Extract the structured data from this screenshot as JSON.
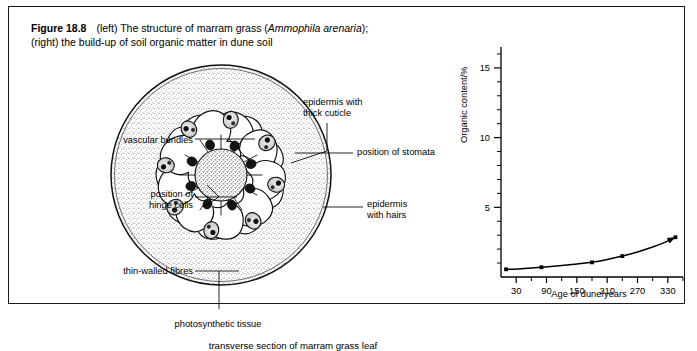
{
  "figure": {
    "number_label": "Figure 18.8",
    "caption_line1_a": "(left) The structure of marram grass (",
    "caption_species": "Ammophila arenaria",
    "caption_line1_b": ");",
    "caption_line2": "(right) the build-up of soil organic matter in dune soil"
  },
  "leaf_diagram": {
    "subcaption": "transverse section of marram grass leaf",
    "labels": {
      "vascular_bundles": "vascular bundles",
      "hinge_cells": "position of\nhinge cells",
      "thin_walled_fibres": "thin-walled fibres",
      "photosynthetic_tissue": "photosynthetic tissue",
      "epidermis_cuticle": "epidermis with\nthick cuticle",
      "stomata": "position of stomata",
      "epidermis_hairs": "epidermis\nwith hairs"
    }
  },
  "chart_data": {
    "type": "line",
    "title": "",
    "xlabel": "Age of dune/years",
    "ylabel": "Organic content/%",
    "xlim": [
      0,
      360
    ],
    "ylim": [
      0,
      16.5
    ],
    "x_ticks_major": [
      30,
      90,
      150,
      210,
      270,
      330
    ],
    "x_ticks_minor": [
      60,
      120,
      180,
      240,
      300,
      360
    ],
    "y_ticks_major": [
      5,
      10,
      15
    ],
    "y_ticks_minor": [
      1,
      2,
      3,
      4,
      6,
      7,
      8,
      9,
      11,
      12,
      13,
      14,
      16
    ],
    "grid": false,
    "legend": null,
    "series": [
      {
        "name": "soil organic content",
        "marker": "point",
        "arrow_end": true,
        "x": [
          10,
          80,
          180,
          240,
          345
        ],
        "y": [
          0.55,
          0.7,
          1.05,
          1.5,
          2.85
        ]
      }
    ],
    "curve_points": [
      [
        10,
        0.55
      ],
      [
        40,
        0.6
      ],
      [
        80,
        0.7
      ],
      [
        120,
        0.82
      ],
      [
        150,
        0.93
      ],
      [
        180,
        1.05
      ],
      [
        210,
        1.25
      ],
      [
        240,
        1.5
      ],
      [
        270,
        1.8
      ],
      [
        300,
        2.15
      ],
      [
        325,
        2.5
      ],
      [
        345,
        2.85
      ]
    ]
  }
}
